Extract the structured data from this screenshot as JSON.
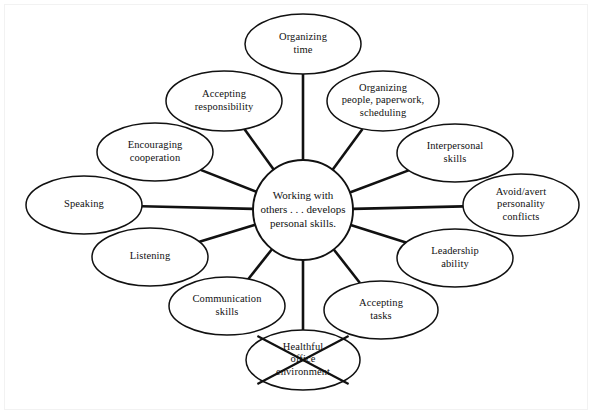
{
  "diagram": {
    "type": "cluster-web-diagram",
    "center": {
      "lines": [
        "Working with",
        "others . . . develops",
        "personal skills."
      ],
      "cx": 303,
      "cy": 210,
      "r": 50
    },
    "nodes": [
      {
        "id": "organizing-time",
        "lines": [
          "Organizing",
          "time"
        ],
        "cx": 303,
        "cy": 44,
        "rx": 58,
        "ry": 30,
        "angle": -90,
        "struck_out": false
      },
      {
        "id": "organizing-people-paperwork-scheduling",
        "lines": [
          "Organizing",
          "people, paperwork,",
          "scheduling"
        ],
        "cx": 383,
        "cy": 101,
        "rx": 56,
        "ry": 30,
        "angle": -55,
        "struck_out": false
      },
      {
        "id": "interpersonal-skills",
        "lines": [
          "Interpersonal",
          "skills"
        ],
        "cx": 455,
        "cy": 153,
        "rx": 58,
        "ry": 29,
        "angle": -30,
        "struck_out": false
      },
      {
        "id": "avoid-avert-personality-conflicts",
        "lines": [
          "Avoid/avert",
          "personality",
          "conflicts"
        ],
        "cx": 521,
        "cy": 205,
        "rx": 58,
        "ry": 31,
        "angle": 0,
        "struck_out": false
      },
      {
        "id": "leadership-ability",
        "lines": [
          "Leadership",
          "ability"
        ],
        "cx": 455,
        "cy": 258,
        "rx": 58,
        "ry": 29,
        "angle": 30,
        "struck_out": false
      },
      {
        "id": "accepting-tasks",
        "lines": [
          "Accepting",
          "tasks"
        ],
        "cx": 381,
        "cy": 310,
        "rx": 57,
        "ry": 29,
        "angle": 58,
        "struck_out": false
      },
      {
        "id": "healthful-office-environment",
        "lines": [
          "Healthful",
          "office",
          "environment"
        ],
        "cx": 303,
        "cy": 360,
        "rx": 57,
        "ry": 30,
        "angle": 90,
        "struck_out": true
      },
      {
        "id": "communication-skills",
        "lines": [
          "Communication",
          "skills"
        ],
        "cx": 227,
        "cy": 306,
        "rx": 58,
        "ry": 29,
        "angle": 122,
        "struck_out": false
      },
      {
        "id": "listening",
        "lines": [
          "Listening"
        ],
        "cx": 150,
        "cy": 257,
        "rx": 58,
        "ry": 29,
        "angle": 150,
        "struck_out": false
      },
      {
        "id": "speaking",
        "lines": [
          "Speaking"
        ],
        "cx": 84,
        "cy": 205,
        "rx": 58,
        "ry": 29,
        "angle": 180,
        "struck_out": false
      },
      {
        "id": "encouraging-cooperation",
        "lines": [
          "Encouraging",
          "cooperation"
        ],
        "cx": 155,
        "cy": 152,
        "rx": 58,
        "ry": 29,
        "angle": -150,
        "struck_out": false
      },
      {
        "id": "accepting-responsibility",
        "lines": [
          "Accepting",
          "responsibility"
        ],
        "cx": 224,
        "cy": 101,
        "rx": 58,
        "ry": 30,
        "angle": -122,
        "struck_out": false
      }
    ],
    "colors": {
      "stroke": "#111111",
      "fill": "#ffffff",
      "background": "#ffffff"
    }
  }
}
